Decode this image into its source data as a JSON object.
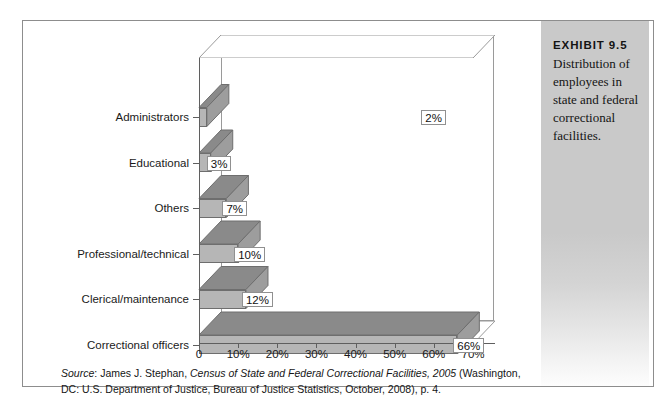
{
  "exhibit": {
    "number": "EXHIBIT 9.5",
    "caption": "Distribution of employees in state and federal correctional facilities."
  },
  "source_note": {
    "label": "Source",
    "separator": ": ",
    "author": "James J. Stephan, ",
    "title": "Census of State and Federal Correctional Facilities, 2005",
    "rest": " (Washington, DC: U.S. Department of Justice, Bureau of Justice Statistics, October, 2008), p. 4."
  },
  "chart_data": {
    "type": "bar",
    "orientation": "horizontal",
    "title": "Distribution of employees in state and federal correctional facilities",
    "xlabel": "",
    "ylabel": "",
    "xlim": [
      0,
      70
    ],
    "grid": false,
    "legend": false,
    "style": "3d-isometric",
    "categories": [
      "Administrators",
      "Educational",
      "Others",
      "Professional/technical",
      "Clerical/maintenance",
      "Correctional officers"
    ],
    "values": [
      2,
      3,
      7,
      10,
      12,
      66
    ],
    "data_labels": [
      "2%",
      "3%",
      "7%",
      "10%",
      "12%",
      "66%"
    ],
    "xticks": [
      0,
      10,
      20,
      30,
      40,
      50,
      60,
      70
    ],
    "xtick_labels": [
      "0",
      "10%",
      "20%",
      "30%",
      "40%",
      "50%",
      "60%",
      "70%"
    ],
    "colors": {
      "bar_front": "#b6b6b6",
      "bar_top": "#8a8a8a",
      "bar_side": "#9d9d9d",
      "outline": "#6e6e6e",
      "axis": "#5f5f5f",
      "panel": "#c9c9c9"
    }
  }
}
